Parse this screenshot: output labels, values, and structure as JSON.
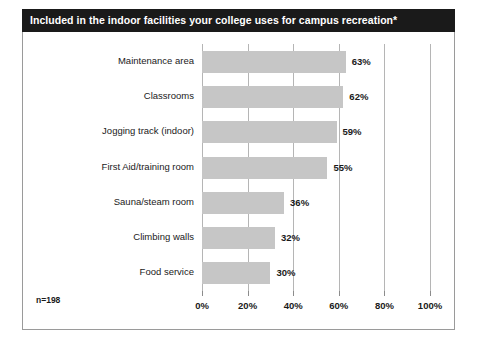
{
  "title": "Included in the indoor facilities your college uses for campus recreation*",
  "note": "n=198",
  "chart_data": {
    "type": "bar",
    "orientation": "horizontal",
    "title": "Included in the indoor facilities your college uses for campus recreation*",
    "xlabel": "",
    "ylabel": "",
    "xlim": [
      0,
      100
    ],
    "grid": "vertical",
    "legend": "none",
    "annotation": "n=198",
    "value_suffix": "%",
    "categories": [
      "Maintenance area",
      "Classrooms",
      "Jogging track (indoor)",
      "First Aid/training room",
      "Sauna/steam room",
      "Climbing walls",
      "Food service"
    ],
    "values": [
      63,
      62,
      59,
      55,
      36,
      32,
      30
    ],
    "value_labels": [
      "63%",
      "62%",
      "59%",
      "55%",
      "36%",
      "32%",
      "30%"
    ],
    "xticks": [
      0,
      20,
      40,
      60,
      80,
      100
    ],
    "xtick_labels": [
      "0%",
      "20%",
      "40%",
      "60%",
      "80%",
      "100%"
    ],
    "bar_color": "#c6c6c6",
    "grid_color": "#b5b5b5",
    "title_bg_color": "#1a1a1a",
    "title_text_color": "#ffffff"
  }
}
